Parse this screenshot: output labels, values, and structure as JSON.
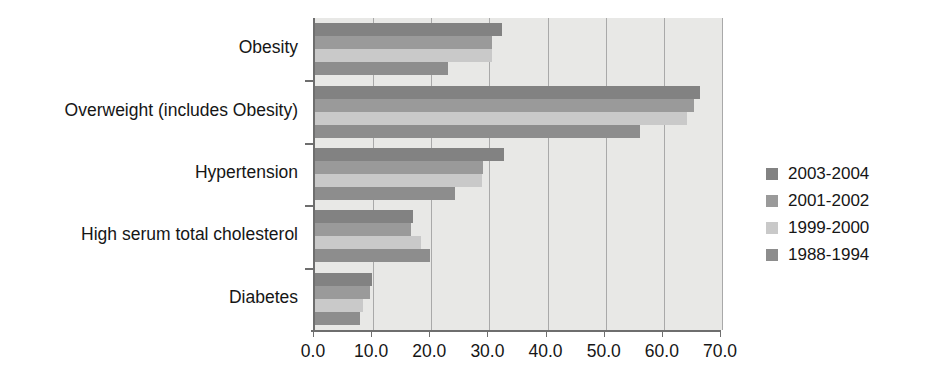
{
  "chart_data": {
    "type": "bar",
    "orientation": "horizontal",
    "title": "",
    "xlabel": "",
    "ylabel": "",
    "xlim": [
      0,
      70
    ],
    "xticks": [
      "0.0",
      "10.0",
      "20.0",
      "30.0",
      "40.0",
      "50.0",
      "60.0",
      "70.0"
    ],
    "xtick_values": [
      0,
      10,
      20,
      30,
      40,
      50,
      60,
      70
    ],
    "grid": true,
    "grid_axis": "x",
    "legend_position": "right",
    "categories": [
      "Obesity",
      "Overweight (includes Obesity)",
      "Hypertension",
      "High serum total cholesterol",
      "Diabetes"
    ],
    "series": [
      {
        "name": "2003-2004",
        "color": "#828282",
        "values": [
          32.2,
          66.2,
          32.5,
          16.9,
          9.8
        ]
      },
      {
        "name": "2001-2002",
        "color": "#9a9a9a",
        "values": [
          30.5,
          65.2,
          28.9,
          16.5,
          9.4
        ]
      },
      {
        "name": "1999-2000",
        "color": "#c9c9c9",
        "values": [
          30.5,
          64.0,
          28.7,
          18.3,
          8.2
        ]
      },
      {
        "name": "1988-1994",
        "color": "#8d8d8d",
        "values": [
          22.9,
          55.9,
          24.1,
          19.7,
          7.8
        ]
      }
    ]
  },
  "legend": {
    "items": [
      {
        "label": "2003-2004",
        "color": "#828282"
      },
      {
        "label": "2001-2002",
        "color": "#9a9a9a"
      },
      {
        "label": "1999-2000",
        "color": "#c9c9c9"
      },
      {
        "label": "1988-1994",
        "color": "#8d8d8d"
      }
    ]
  },
  "colors": {
    "plot_background": "#e8e8e6",
    "gridline": "#a9a9a9",
    "axis": "#6e6e6e",
    "text": "#161616"
  }
}
